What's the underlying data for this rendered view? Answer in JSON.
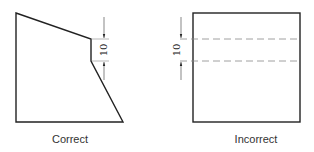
{
  "diagram": {
    "left": {
      "caption": "Correct",
      "dimension": "10"
    },
    "right": {
      "caption": "Incorrect",
      "dimension": "10"
    },
    "colors": {
      "outline": "#222222",
      "dashed": "#888888",
      "thin": "#999999"
    }
  }
}
